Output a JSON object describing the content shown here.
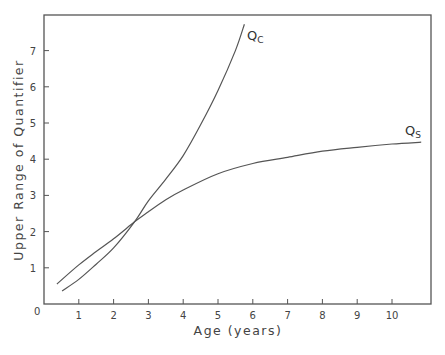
{
  "chart_data": {
    "type": "line",
    "title": "",
    "xlabel": "Age (years)",
    "ylabel": "Upper Range of Quantifier",
    "xlim": [
      0,
      11.2
    ],
    "ylim": [
      0,
      7.95
    ],
    "xticks": [
      1,
      2,
      3,
      4,
      5,
      6,
      7,
      8,
      9,
      10
    ],
    "yticks": [
      1,
      2,
      3,
      4,
      5,
      6,
      7
    ],
    "origin_label": "0",
    "grid": false,
    "legend": "inline labels at curve ends",
    "series": [
      {
        "name": "Qc",
        "label_main": "Q",
        "label_sub": "C",
        "x": [
          0.52,
          1.0,
          1.5,
          2.0,
          2.6,
          3.0,
          3.5,
          4.0,
          4.5,
          5.0,
          5.5,
          5.76
        ],
        "y": [
          0.36,
          0.68,
          1.1,
          1.55,
          2.27,
          2.85,
          3.45,
          4.1,
          4.95,
          5.9,
          7.0,
          7.73
        ]
      },
      {
        "name": "Qs",
        "label_main": "Q",
        "label_sub": "S",
        "x": [
          0.37,
          1.0,
          1.5,
          2.0,
          2.6,
          3.0,
          3.5,
          4.0,
          5.0,
          6.0,
          7.0,
          8.0,
          9.0,
          10.0,
          10.84
        ],
        "y": [
          0.55,
          1.08,
          1.45,
          1.8,
          2.27,
          2.55,
          2.88,
          3.15,
          3.6,
          3.88,
          4.05,
          4.22,
          4.33,
          4.42,
          4.47
        ]
      }
    ]
  }
}
